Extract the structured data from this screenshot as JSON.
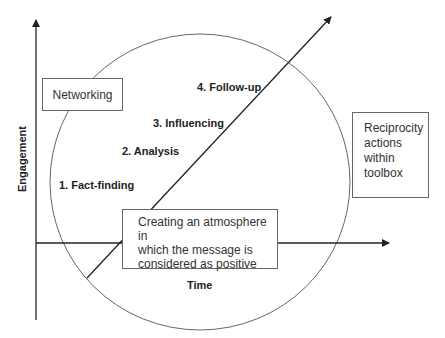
{
  "diagram": {
    "axes": {
      "y_label": "Engagement",
      "x_label": "Time"
    },
    "stages": [
      {
        "label": "1. Fact-finding"
      },
      {
        "label": "2. Analysis"
      },
      {
        "label": "3. Influencing"
      },
      {
        "label": "4. Follow-up"
      }
    ],
    "boxes": {
      "networking": "Networking",
      "reciprocity": [
        "Reciprocity",
        "actions",
        "within",
        "toolbox"
      ],
      "atmosphere": [
        "Creating an atmosphere in",
        "which the message is",
        "considered as positive"
      ]
    },
    "colors": {
      "line": "#222222",
      "circle": "#555555",
      "box_border": "#666666"
    }
  }
}
